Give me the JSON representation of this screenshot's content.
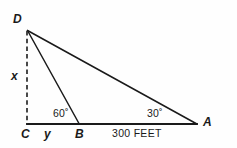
{
  "figure": {
    "type": "geometry-diagram",
    "background_color": "#fefefe",
    "line_color": "#1a1a1a",
    "vertices": [
      {
        "id": "D",
        "label": "D",
        "x": 27,
        "y": 30,
        "label_x": 13,
        "label_y": 13
      },
      {
        "id": "C",
        "label": "C",
        "x": 27,
        "y": 124,
        "label_x": 21,
        "label_y": 128
      },
      {
        "id": "B",
        "label": "B",
        "x": 79,
        "y": 124,
        "label_x": 75,
        "label_y": 128
      },
      {
        "id": "A",
        "label": "A",
        "x": 196,
        "y": 124,
        "label_x": 203,
        "label_y": 116
      }
    ],
    "segments": [
      {
        "name": "baseline-CA",
        "from": "C",
        "to": "A",
        "style": "solid",
        "width": 1.8
      },
      {
        "name": "hypotenuse-DA",
        "from": "D",
        "to": "A",
        "style": "solid",
        "width": 1.5
      },
      {
        "name": "cevian-DB",
        "from": "D",
        "to": "B",
        "style": "solid",
        "width": 1.5
      },
      {
        "name": "altitude-DC",
        "from": "D",
        "to": "C",
        "style": "dashed",
        "width": 1.5
      }
    ],
    "labels": {
      "altitude": {
        "text": "x",
        "x": 11,
        "y": 70
      },
      "base_segment": {
        "text": "y",
        "x": 44,
        "y": 128
      },
      "angle_at_B": {
        "text": "60˚",
        "x": 53,
        "y": 108
      },
      "angle_at_A": {
        "text": "30˚",
        "x": 147,
        "y": 108
      },
      "distance_BA": {
        "text": "300 FEET",
        "x": 112,
        "y": 128
      }
    }
  }
}
